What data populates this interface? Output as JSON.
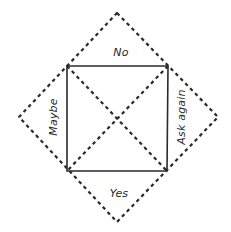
{
  "diagram": {
    "type": "paper-fortune-teller-template",
    "colors": {
      "line": "#2a2a2a",
      "background": "#ffffff"
    },
    "outer_diamond": {
      "style": "dashed",
      "points": {
        "top": [
          117,
          13
        ],
        "right": [
          218,
          117
        ],
        "bottom": [
          117,
          222
        ],
        "left": [
          19,
          117
        ]
      }
    },
    "inner_square": {
      "style": "solid",
      "corners": {
        "top_left": [
          67,
          66
        ],
        "top_right": [
          168,
          66
        ],
        "bottom_right": [
          167,
          171
        ],
        "bottom_left": [
          67,
          171
        ]
      }
    },
    "diagonals": {
      "style": "dashed",
      "count": 2
    },
    "labels": {
      "top": "No",
      "left": "Maybe",
      "right": "Ask again",
      "bottom": "Yes"
    }
  }
}
